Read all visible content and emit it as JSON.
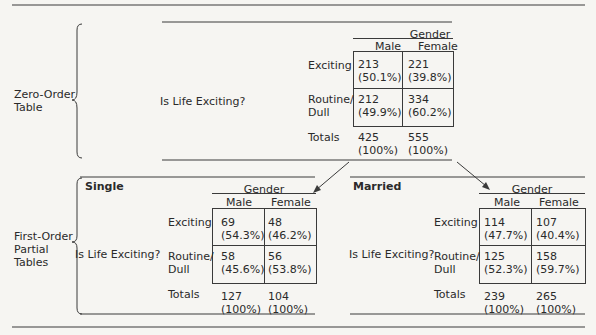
{
  "zero_order": {
    "section_label_line1": "Zero-Order",
    "section_label_line2": "Table",
    "row_variable": "Is Life Exciting?",
    "column_variable": "Gender",
    "columns": [
      "Male",
      "Female"
    ],
    "rows": [
      {
        "label_line1": "Exciting",
        "label_line2": "",
        "cells": [
          {
            "count": "213",
            "pct": "(50.1%)"
          },
          {
            "count": "221",
            "pct": "(39.8%)"
          }
        ]
      },
      {
        "label_line1": "Routine/",
        "label_line2": "Dull",
        "cells": [
          {
            "count": "212",
            "pct": "(49.9%)"
          },
          {
            "count": "334",
            "pct": "(60.2%)"
          }
        ]
      }
    ],
    "totals": {
      "label": "Totals",
      "cells": [
        {
          "count": "425",
          "pct": "(100%)"
        },
        {
          "count": "555",
          "pct": "(100%)"
        }
      ]
    }
  },
  "first_order": {
    "section_label_line1": "First-Order",
    "section_label_line2": "Partial",
    "section_label_line3": "Tables",
    "tables": [
      {
        "title": "Single",
        "row_variable": "Is Life Exciting?",
        "column_variable": "Gender",
        "columns": [
          "Male",
          "Female"
        ],
        "rows": [
          {
            "label_line1": "Exciting",
            "label_line2": "",
            "cells": [
              {
                "count": "69",
                "pct": "(54.3%)"
              },
              {
                "count": "48",
                "pct": "(46.2%)"
              }
            ]
          },
          {
            "label_line1": "Routine/",
            "label_line2": "Dull",
            "cells": [
              {
                "count": "58",
                "pct": "(45.6%)"
              },
              {
                "count": "56",
                "pct": "(53.8%)"
              }
            ]
          }
        ],
        "totals": {
          "label": "Totals",
          "cells": [
            {
              "count": "127",
              "pct": "(100%)"
            },
            {
              "count": "104",
              "pct": "(100%)"
            }
          ]
        }
      },
      {
        "title": "Married",
        "row_variable": "Is Life Exciting?",
        "column_variable": "Gender",
        "columns": [
          "Male",
          "Female"
        ],
        "rows": [
          {
            "label_line1": "Exciting",
            "label_line2": "",
            "cells": [
              {
                "count": "114",
                "pct": "(47.7%)"
              },
              {
                "count": "107",
                "pct": "(40.4%)"
              }
            ]
          },
          {
            "label_line1": "Routine/",
            "label_line2": "Dull",
            "cells": [
              {
                "count": "125",
                "pct": "(52.3%)"
              },
              {
                "count": "158",
                "pct": "(59.7%)"
              }
            ]
          }
        ],
        "totals": {
          "label": "Totals",
          "cells": [
            {
              "count": "239",
              "pct": "(100%)"
            },
            {
              "count": "265",
              "pct": "(100%)"
            }
          ]
        }
      }
    ]
  }
}
